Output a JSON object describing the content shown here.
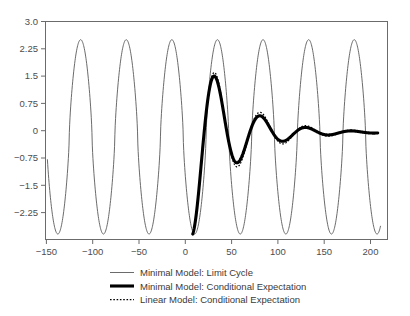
{
  "chart_data": {
    "type": "line",
    "title": "",
    "subtitle": "",
    "xlabel": "",
    "ylabel": "",
    "xlim": [
      -155,
      205
    ],
    "ylim": [
      -3.0,
      3.0
    ],
    "grid": false,
    "legend_position": "bottom",
    "x_ticks": [
      -150,
      -100,
      -50,
      0,
      50,
      100,
      150,
      200
    ],
    "x_tick_labels": [
      "−150",
      "−100",
      "−50",
      "0",
      "50",
      "100",
      "150",
      "200"
    ],
    "y_ticks": [
      3.0,
      2.25,
      1.5,
      0.75,
      0,
      -0.75,
      -1.5,
      -2.25
    ],
    "y_tick_labels": [
      "3.0",
      "2.25",
      "1.5",
      "0.75",
      "0",
      "−0.75",
      "−1.5",
      "−2.25"
    ],
    "series": [
      {
        "name": "Minimal Model: Limit Cycle",
        "style": "thin-solid",
        "color": "#5a5a5a",
        "description": "Sustained relaxation-type oscillation spanning the full x range, peaks at about 2.5 and troughs at about -2.85, period about 48 x-units.",
        "amplitude_peak": 2.5,
        "amplitude_trough": -2.85,
        "period": 48,
        "peaks_x": [
          -118,
          -70,
          -22,
          26,
          74,
          120,
          166
        ],
        "troughs_x": [
          -143,
          -95,
          -47,
          1,
          48,
          96,
          142,
          190
        ]
      },
      {
        "name": "Minimal Model: Conditional Expectation",
        "style": "thick-solid",
        "color": "#000000",
        "description": "Damped oscillation starting at x=0, y=-2.85, rising to 1.35 near x=20, decaying toward about -0.05 by x=195.",
        "x_start": 0,
        "x_end": 195,
        "peaks": [
          {
            "x": 20,
            "y": 1.35
          },
          {
            "x": 69,
            "y": 0.32
          },
          {
            "x": 117,
            "y": 0.1
          },
          {
            "x": 161,
            "y": 0.04
          }
        ],
        "troughs": [
          {
            "x": 0,
            "y": -2.85
          },
          {
            "x": 46,
            "y": -0.93
          },
          {
            "x": 94,
            "y": -0.26
          },
          {
            "x": 140,
            "y": -0.11
          },
          {
            "x": 185,
            "y": -0.07
          }
        ]
      },
      {
        "name": "Linear Model: Conditional Expectation",
        "style": "dotted",
        "color": "#000000",
        "description": "Damped oscillation nearly overlapping the minimal model conditional expectation, slightly larger amplitude at later peaks.",
        "x_start": 0,
        "x_end": 185,
        "peaks": [
          {
            "x": 20,
            "y": 1.33
          },
          {
            "x": 68,
            "y": 0.46
          },
          {
            "x": 116,
            "y": 0.17
          },
          {
            "x": 160,
            "y": 0.08
          }
        ],
        "troughs": [
          {
            "x": 0,
            "y": -2.85
          },
          {
            "x": 46,
            "y": -1.0
          },
          {
            "x": 93,
            "y": -0.3
          },
          {
            "x": 139,
            "y": -0.13
          }
        ]
      }
    ]
  },
  "legend": {
    "items": [
      {
        "label": "Minimal Model: Limit Cycle",
        "style": "thin-solid"
      },
      {
        "label": "Minimal Model: Conditional Expectation",
        "style": "thick-solid"
      },
      {
        "label": "Linear Model: Conditional Expectation",
        "style": "dotted"
      }
    ]
  }
}
